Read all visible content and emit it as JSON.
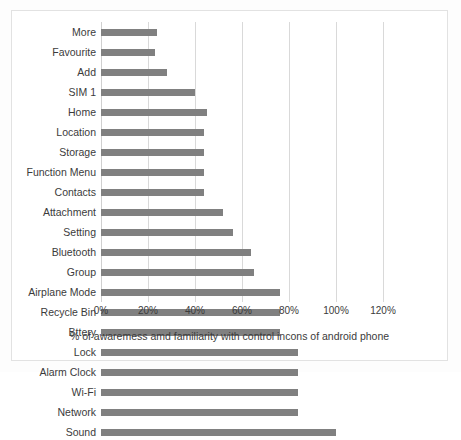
{
  "chart_data": {
    "type": "bar",
    "orientation": "horizontal",
    "title": "",
    "xlabel": "% of awaremess amd familiarity with control incons of android phone",
    "ylabel": "",
    "xlim": [
      0,
      120
    ],
    "xtick_labels": [
      "0%",
      "20%",
      "40%",
      "60%",
      "80%",
      "100%",
      "120%"
    ],
    "xticks": [
      0,
      20,
      40,
      60,
      80,
      100,
      120
    ],
    "grid": "vertical",
    "legend": "none",
    "bar_color": "#808080",
    "categories": [
      "More",
      "Favourite",
      "Add",
      "SIM 1",
      "Home",
      "Location",
      "Storage",
      "Function Menu",
      "Contacts",
      "Attachment",
      "Setting",
      "Bluetooth",
      "Group",
      "Airplane Mode",
      "Recycle Bin",
      "Bttery",
      "Lock",
      "Alarm Clock",
      "Wi-Fi",
      "Network",
      "Sound"
    ],
    "values": [
      24,
      23,
      28,
      40,
      45,
      44,
      44,
      44,
      44,
      52,
      56,
      64,
      65,
      76,
      76,
      76,
      84,
      84,
      84,
      84,
      100
    ]
  }
}
